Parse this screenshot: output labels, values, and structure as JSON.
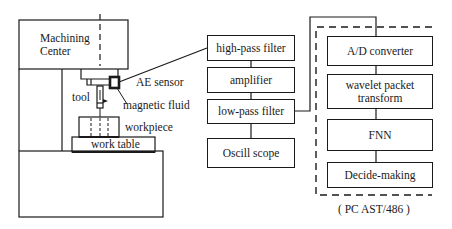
{
  "machine": {
    "title_line1": "Machining",
    "title_line2": "Center",
    "labels": {
      "ae_sensor": "AE sensor",
      "tool": "tool",
      "magnetic_fluid": "magnetic fluid",
      "workpiece": "workpiece",
      "work_table": "work table"
    }
  },
  "signal_chain": {
    "blocks": [
      {
        "label": "high-pass filter"
      },
      {
        "label": "amplifier"
      },
      {
        "label": "low-pass filter"
      },
      {
        "label": "Oscill scope"
      }
    ]
  },
  "pc": {
    "blocks": [
      {
        "label": "A/D converter"
      },
      {
        "label": "wavelet packet transform",
        "line1": "wavelet packet",
        "line2": "transform"
      },
      {
        "label": "FNN"
      },
      {
        "label": "Decide-making"
      }
    ],
    "caption": "( PC AST/486 )"
  },
  "colors": {
    "stroke": "#1a1a1a",
    "background": "#ffffff"
  }
}
